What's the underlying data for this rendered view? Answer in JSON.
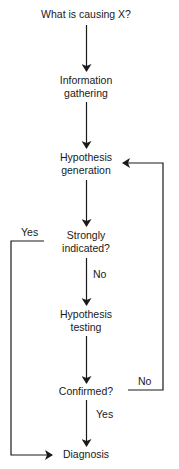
{
  "diagram": {
    "type": "flowchart",
    "nodes": {
      "start": {
        "line1": "What is causing X?"
      },
      "info": {
        "line1": "Information",
        "line2": "gathering"
      },
      "hypgen": {
        "line1": "Hypothesis",
        "line2": "generation"
      },
      "strong": {
        "line1": "Strongly",
        "line2": "indicated?"
      },
      "hyptest": {
        "line1": "Hypothesis",
        "line2": "testing"
      },
      "confirmed": {
        "line1": "Confirmed?"
      },
      "diagnosis": {
        "line1": "Diagnosis"
      }
    },
    "edge_labels": {
      "strong_yes": "Yes",
      "strong_no": "No",
      "confirmed_no": "No",
      "confirmed_yes": "Yes"
    },
    "edges": [
      {
        "from": "start",
        "to": "info"
      },
      {
        "from": "info",
        "to": "hypgen"
      },
      {
        "from": "hypgen",
        "to": "strong"
      },
      {
        "from": "strong",
        "to": "hyptest",
        "label": "No"
      },
      {
        "from": "strong",
        "to": "diagnosis",
        "label": "Yes"
      },
      {
        "from": "hyptest",
        "to": "confirmed"
      },
      {
        "from": "confirmed",
        "to": "hypgen",
        "label": "No"
      },
      {
        "from": "confirmed",
        "to": "diagnosis",
        "label": "Yes"
      }
    ],
    "colors": {
      "line": "#1a1a1a",
      "background": "#ffffff"
    }
  }
}
